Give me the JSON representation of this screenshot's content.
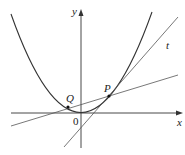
{
  "diagram": {
    "type": "graph",
    "labels": {
      "x_axis": "x",
      "y_axis": "y",
      "origin": "0",
      "point_p": "P",
      "point_q": "Q",
      "tangent": "t"
    },
    "colors": {
      "stroke": "#333333",
      "background": "#ffffff"
    }
  }
}
